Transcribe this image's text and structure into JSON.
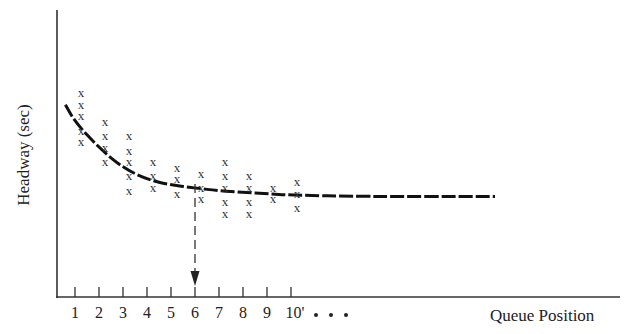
{
  "chart_data": {
    "type": "scatter",
    "title": "",
    "xlabel": "Queue Position",
    "ylabel": "Headway (sec)",
    "categories": [
      "1",
      "2",
      "3",
      "4",
      "5",
      "6",
      "7",
      "8",
      "9",
      "10'"
    ],
    "continuation": "• • •",
    "grid": false,
    "legend": "none",
    "y_ticks": "none (qualitative axis)",
    "scatter_points": [
      {
        "position": 1,
        "marks": 5,
        "relative_headway": [
          0.71,
          0.67,
          0.63,
          0.58,
          0.54
        ]
      },
      {
        "position": 2,
        "marks": 4,
        "relative_headway": [
          0.61,
          0.56,
          0.52,
          0.47
        ]
      },
      {
        "position": 3,
        "marks": 5,
        "relative_headway": [
          0.56,
          0.51,
          0.47,
          0.42,
          0.37
        ]
      },
      {
        "position": 4,
        "marks": 3,
        "relative_headway": [
          0.47,
          0.42,
          0.38
        ]
      },
      {
        "position": 5,
        "marks": 3,
        "relative_headway": [
          0.45,
          0.41,
          0.36
        ]
      },
      {
        "position": 6,
        "marks": 3,
        "relative_headway": [
          0.43,
          0.38,
          0.34
        ]
      },
      {
        "position": 7,
        "marks": 5,
        "relative_headway": [
          0.47,
          0.42,
          0.38,
          0.33,
          0.29
        ]
      },
      {
        "position": 8,
        "marks": 4,
        "relative_headway": [
          0.42,
          0.38,
          0.33,
          0.29
        ]
      },
      {
        "position": 9,
        "marks": 2,
        "relative_headway": [
          0.38,
          0.34
        ]
      },
      {
        "position": 10,
        "marks": 3,
        "relative_headway": [
          0.4,
          0.36,
          0.31
        ]
      }
    ],
    "series": [
      {
        "name": "fitted headway curve",
        "type": "line",
        "description": "decreasing curve that levels off to a constant saturation headway after about position 6",
        "x": [
          0.6,
          1,
          2,
          3,
          4,
          5,
          6,
          7,
          8,
          9,
          10,
          13,
          18.5
        ],
        "relative_headway": [
          0.67,
          0.61,
          0.52,
          0.45,
          0.41,
          0.39,
          0.38,
          0.37,
          0.365,
          0.36,
          0.355,
          0.35,
          0.35
        ]
      }
    ],
    "annotations": [
      {
        "type": "dashed-arrow",
        "at_position": 6,
        "direction": "down",
        "description": "marks the queue position where headways become constant"
      }
    ]
  },
  "axes": {
    "y_label": "Headway (sec)",
    "x_label": "Queue Position",
    "continuation_dots": "• • •"
  }
}
